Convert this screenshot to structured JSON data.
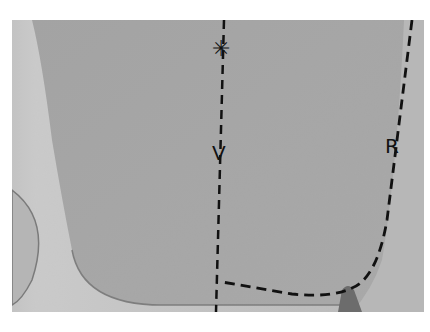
{
  "photo": {
    "subject": "fabric pattern piece with dashed guide lines",
    "colors": {
      "background_fabric": "#c4c4c4",
      "garment_piece": "#a9a9a9",
      "left_shadow": "#d2d2d2",
      "dash_line": "#111111"
    }
  },
  "annotations": {
    "center_line_label": "V",
    "curve_line_label": "R",
    "marker_symbol": "✳"
  }
}
